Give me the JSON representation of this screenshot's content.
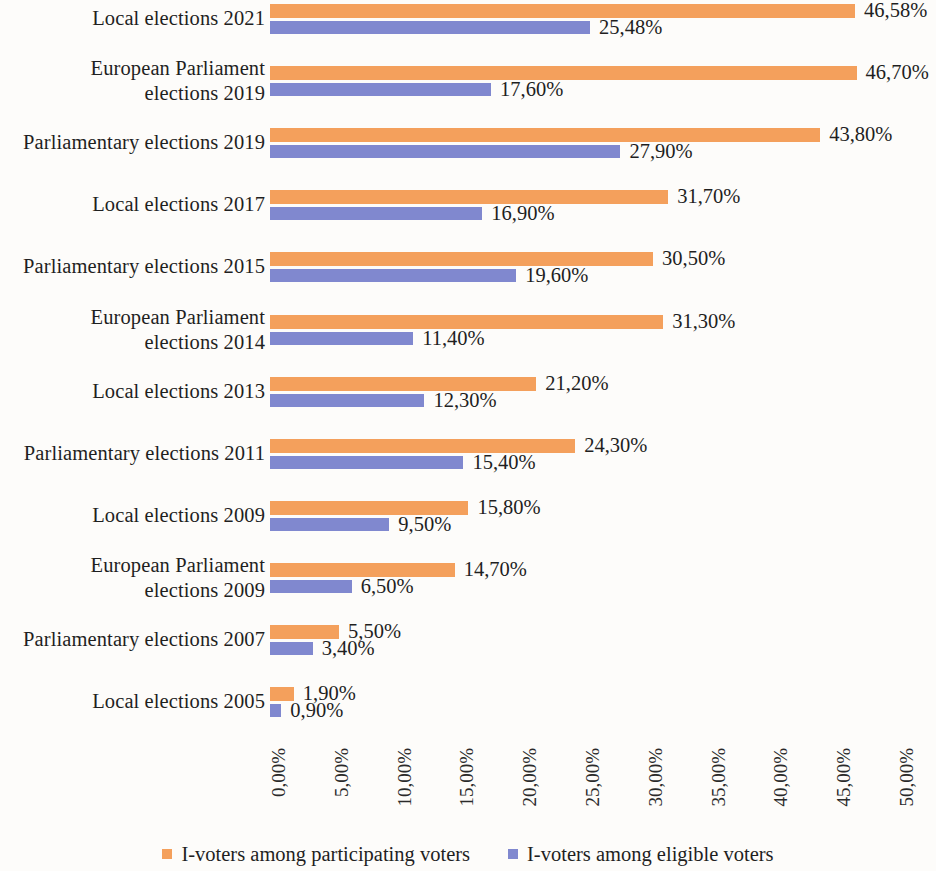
{
  "chart_data": {
    "type": "bar",
    "orientation": "horizontal",
    "title": "",
    "subtitle": "",
    "xlabel": "",
    "ylabel": "",
    "xlim": [
      0,
      50
    ],
    "grid": false,
    "legend_position": "bottom-center",
    "x_tick_labels": [
      "0,00%",
      "5,00%",
      "10,00%",
      "15,00%",
      "20,00%",
      "25,00%",
      "30,00%",
      "35,00%",
      "40,00%",
      "45,00%",
      "50,00%"
    ],
    "x_tick_values": [
      0,
      5,
      10,
      15,
      20,
      25,
      30,
      35,
      40,
      45,
      50
    ],
    "categories": [
      "Local elections 2021",
      "European Parliament elections 2019",
      "Parliamentary elections 2019",
      "Local elections 2017",
      "Parliamentary elections 2015",
      "European Parliament elections 2014",
      "Local elections 2013",
      "Parliamentary elections 2011",
      "Local elections 2009",
      "European Parliament elections 2009",
      "Parliamentary elections 2007",
      "Local elections 2005"
    ],
    "category_lines": [
      [
        "Local elections 2021"
      ],
      [
        "European Parliament",
        "elections 2019"
      ],
      [
        "Parliamentary elections 2019"
      ],
      [
        "Local elections 2017"
      ],
      [
        "Parliamentary elections 2015"
      ],
      [
        "European Parliament",
        "elections 2014"
      ],
      [
        "Local elections 2013"
      ],
      [
        "Parliamentary elections 2011"
      ],
      [
        "Local elections 2009"
      ],
      [
        "European Parliament",
        "elections 2009"
      ],
      [
        "Parliamentary elections 2007"
      ],
      [
        "Local elections 2005"
      ]
    ],
    "series": [
      {
        "name": "I-voters among participating voters",
        "color": "#f4a05c",
        "values": [
          46.58,
          46.7,
          43.8,
          31.7,
          30.5,
          31.3,
          21.2,
          24.3,
          15.8,
          14.7,
          5.5,
          1.9
        ],
        "labels": [
          "46,58%",
          "46,70%",
          "43,80%",
          "31,70%",
          "30,50%",
          "31,30%",
          "21,20%",
          "24,30%",
          "15,80%",
          "14,70%",
          "5,50%",
          "1,90%"
        ]
      },
      {
        "name": "I-voters among eligible voters",
        "color": "#8088cf",
        "values": [
          25.48,
          17.6,
          27.9,
          16.9,
          19.6,
          11.4,
          12.3,
          15.4,
          9.5,
          6.5,
          3.4,
          0.9
        ],
        "labels": [
          "25,48%",
          "17,60%",
          "27,90%",
          "16,90%",
          "19,60%",
          "11,40%",
          "12,30%",
          "15,40%",
          "9,50%",
          "6,50%",
          "3,40%",
          "0,90%"
        ]
      }
    ]
  },
  "legend": {
    "items": [
      {
        "label": "I-voters among participating voters",
        "color": "#f4a05c",
        "marker": "square-marker"
      },
      {
        "label": "I-voters among eligible voters",
        "color": "#8088cf",
        "marker": "square-marker"
      }
    ]
  },
  "colors": {
    "series_participating": "#f4a05c",
    "series_eligible": "#8088cf",
    "background": "#fdfcfa",
    "text": "#1f1f1f"
  }
}
